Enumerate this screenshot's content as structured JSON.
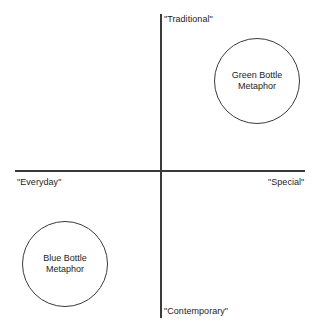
{
  "chart_data": {
    "type": "scatter",
    "title": "",
    "xlabel": "",
    "ylabel": "",
    "axes": {
      "x_axis": {
        "name": "everyday-special-axis",
        "left_pole": "\"Everyday\"",
        "right_pole": "\"Special\""
      },
      "y_axis": {
        "name": "contemporary-traditional-axis",
        "top_pole": "\"Traditional\"",
        "bottom_pole": "\"Contemporary\""
      }
    },
    "grid": false,
    "legend": "none",
    "xlim": [
      -1,
      1
    ],
    "ylim": [
      -1,
      1
    ],
    "items": [
      {
        "label": "Green Bottle\nMetaphor",
        "quadrant": "traditional-special",
        "x": 0.66,
        "y": 0.58
      },
      {
        "label": "Blue Bottle\nMetaphor",
        "quadrant": "contemporary-everyday",
        "x": -0.66,
        "y": -0.64
      }
    ]
  },
  "map": {
    "axis_labels": {
      "top": "\"Traditional\"",
      "bottom": "\"Contemporary\"",
      "left": "\"Everyday\"",
      "right": "\"Special\""
    },
    "bubbles": [
      {
        "id": "green-bottle",
        "label": "Green Bottle\nMetaphor"
      },
      {
        "id": "blue-bottle",
        "label": "Blue Bottle\nMetaphor"
      }
    ]
  },
  "colors": {
    "line": "#3a3a3a",
    "text": "#1d1d1d",
    "background": "#ffffff"
  }
}
